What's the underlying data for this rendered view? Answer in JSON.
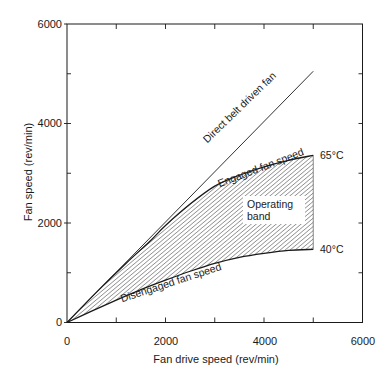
{
  "chart_data": {
    "type": "line",
    "title": "",
    "xlabel": "Fan drive speed (rev/min)",
    "ylabel": "Fan speed (rev/min)",
    "xlim": [
      0,
      6000
    ],
    "ylim": [
      0,
      6000
    ],
    "x_ticks": [
      0,
      2000,
      4000,
      6000
    ],
    "y_ticks": [
      0,
      2000,
      4000,
      6000
    ],
    "x_minor_ticks": [
      1000,
      3000,
      5000
    ],
    "y_minor_ticks": [
      1000,
      3000,
      5000
    ],
    "grid": false,
    "frame": "box",
    "series": [
      {
        "name": "Direct belt driven fan",
        "label": "Direct belt driven fan",
        "x": [
          0,
          5000
        ],
        "y": [
          0,
          5050
        ]
      },
      {
        "name": "Engaged fan speed",
        "label": "Engaged fan speed",
        "end_label": "65°C",
        "x": [
          0,
          600,
          1200,
          1700,
          2000,
          2500,
          3000,
          3500,
          4000,
          4500,
          5000
        ],
        "y": [
          0,
          610,
          1190,
          1650,
          1950,
          2380,
          2740,
          2960,
          3130,
          3260,
          3360
        ]
      },
      {
        "name": "Disengaged fan speed",
        "label": "Disengaged fan speed",
        "end_label": "40°C",
        "x": [
          0,
          500,
          1000,
          1500,
          2000,
          2500,
          3000,
          3500,
          4000,
          4500,
          5000
        ],
        "y": [
          0,
          230,
          450,
          660,
          850,
          1030,
          1190,
          1310,
          1390,
          1450,
          1470
        ]
      }
    ],
    "shaded_region": {
      "label": "Operating band",
      "between": [
        "Disengaged fan speed",
        "Engaged fan speed"
      ],
      "x_range": [
        0,
        5000
      ],
      "fill": "hatched"
    },
    "annotations": [
      {
        "text": "Direct belt driven fan",
        "x": 3400,
        "y": 3900,
        "rotation": -44
      },
      {
        "text": "Engaged fan speed",
        "x": 3650,
        "y": 3050,
        "rotation": -20
      },
      {
        "text": "Disengaged fan speed",
        "x": 2000,
        "y": 650,
        "rotation": -18
      },
      {
        "text": "Operating",
        "x": 4100,
        "y": 2450
      },
      {
        "text": "band",
        "x": 4100,
        "y": 2150
      },
      {
        "text": "65°C",
        "x": 5150,
        "y": 3330
      },
      {
        "text": "40°C",
        "x": 5150,
        "y": 1440
      }
    ]
  },
  "labels": {
    "x_title": "Fan drive speed (rev/min)",
    "y_title": "Fan speed (rev/min)",
    "x_ticks": [
      "0",
      "2000",
      "4000",
      "6000"
    ],
    "y_ticks": [
      "0",
      "2000",
      "4000",
      "6000"
    ],
    "direct": "Direct belt driven fan",
    "engaged": "Engaged fan speed",
    "disengaged": "Disengaged fan speed",
    "band_line1": "Operating",
    "band_line2": "band",
    "temp_high": "65°C",
    "temp_low": "40°C"
  },
  "colors": {
    "line": "#1a1a1a",
    "hatch": "#3a3a3a",
    "background": "#ffffff"
  }
}
